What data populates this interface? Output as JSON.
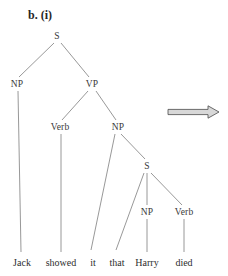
{
  "figure": {
    "label": "b. (i)",
    "label_x": 28,
    "label_y": 8
  },
  "colors": {
    "background": "#ffffff",
    "line": "#8c8c8c",
    "text": "#2e2e2e",
    "arrow_outline": "#4a4a4a",
    "arrow_fill": "#d8d8d8"
  },
  "tree": {
    "nodes": [
      {
        "id": "s-root",
        "label": "S",
        "x": 57,
        "y": 36
      },
      {
        "id": "np-subject",
        "label": "NP",
        "x": 17,
        "y": 84
      },
      {
        "id": "vp",
        "label": "VP",
        "x": 92,
        "y": 84
      },
      {
        "id": "verb-matrix",
        "label": "Verb",
        "x": 60,
        "y": 127
      },
      {
        "id": "np-object",
        "label": "NP",
        "x": 118,
        "y": 127
      },
      {
        "id": "s-embedded",
        "label": "S",
        "x": 147,
        "y": 166
      },
      {
        "id": "np-embedded",
        "label": "NP",
        "x": 147,
        "y": 212
      },
      {
        "id": "verb-embedded",
        "label": "Verb",
        "x": 184,
        "y": 212
      }
    ],
    "leaves": [
      {
        "id": "leaf-jack",
        "label": "Jack",
        "x": 22,
        "y": 262
      },
      {
        "id": "leaf-showed",
        "label": "showed",
        "x": 61,
        "y": 262
      },
      {
        "id": "leaf-it",
        "label": "it",
        "x": 93,
        "y": 262
      },
      {
        "id": "leaf-that",
        "label": "that",
        "x": 117,
        "y": 262
      },
      {
        "id": "leaf-harry",
        "label": "Harry",
        "x": 147,
        "y": 262
      },
      {
        "id": "leaf-died",
        "label": "died",
        "x": 184,
        "y": 262
      }
    ],
    "edges": [
      {
        "id": "edge-s-np",
        "x1": 54,
        "y1": 43,
        "x2": 19,
        "y2": 77
      },
      {
        "id": "edge-s-vp",
        "x1": 61,
        "y1": 43,
        "x2": 89,
        "y2": 77
      },
      {
        "id": "edge-vp-verb",
        "x1": 88,
        "y1": 91,
        "x2": 62,
        "y2": 120
      },
      {
        "id": "edge-vp-np",
        "x1": 96,
        "y1": 91,
        "x2": 116,
        "y2": 120
      },
      {
        "id": "edge-np-it",
        "x1": 115,
        "y1": 134,
        "x2": 91,
        "y2": 250
      },
      {
        "id": "edge-np-s",
        "x1": 121,
        "y1": 134,
        "x2": 145,
        "y2": 159
      },
      {
        "id": "edge-s-that",
        "x1": 144,
        "y1": 173,
        "x2": 116,
        "y2": 250
      },
      {
        "id": "edge-s-npemb",
        "x1": 147,
        "y1": 173,
        "x2": 147,
        "y2": 205
      },
      {
        "id": "edge-s-verbemb",
        "x1": 151,
        "y1": 173,
        "x2": 182,
        "y2": 205
      },
      {
        "id": "edge-npsubj-jack",
        "x1": 18,
        "y1": 91,
        "x2": 21,
        "y2": 252
      },
      {
        "id": "edge-verb-showed",
        "x1": 61,
        "y1": 134,
        "x2": 61,
        "y2": 252
      },
      {
        "id": "edge-npemb-harry",
        "x1": 147,
        "y1": 219,
        "x2": 147,
        "y2": 252
      },
      {
        "id": "edge-verbemb-died",
        "x1": 184,
        "y1": 219,
        "x2": 184,
        "y2": 252
      }
    ]
  },
  "arrow": {
    "id": "derivation-arrow",
    "x_start": 168,
    "x_end": 219,
    "y": 112,
    "label": "rightwards-double-arrow"
  }
}
